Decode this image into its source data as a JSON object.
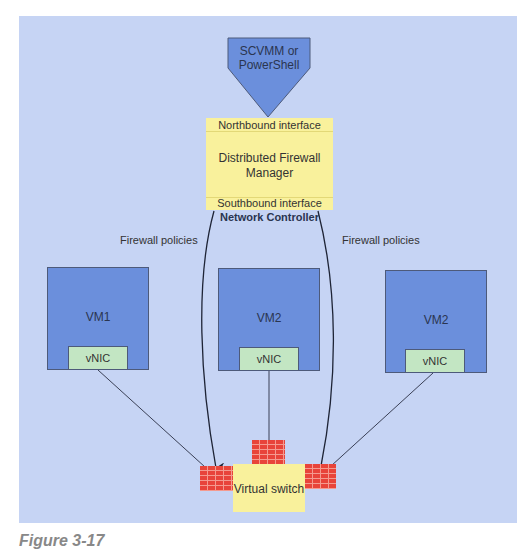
{
  "diagram": {
    "management": {
      "label_line1": "SCVMM or",
      "label_line2": "PowerShell",
      "color": "#6b8fdc"
    },
    "controller": {
      "northbound": "Northbound interface",
      "manager_line1": "Distributed Firewall",
      "manager_line2": "Manager",
      "southbound": "Southbound interface",
      "title": "Network Controller",
      "color": "#f9f19c"
    },
    "edges": {
      "left_policy_label": "Firewall policies",
      "right_policy_label": "Firewall policies"
    },
    "vms": [
      {
        "name": "VM1",
        "nic": "vNIC"
      },
      {
        "name": "VM2",
        "nic": "vNIC"
      },
      {
        "name": "VM2",
        "nic": "vNIC"
      }
    ],
    "switch": {
      "label": "Virtual switch",
      "firewall_color": "#e8443a"
    },
    "background_color": "#c6d4f4"
  },
  "caption": {
    "text": "Figure 3-17"
  }
}
